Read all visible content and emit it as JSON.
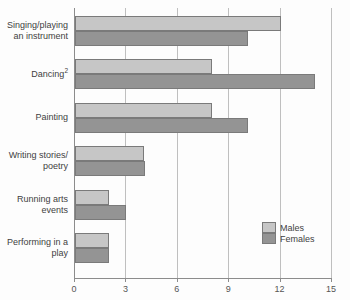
{
  "chart_data": {
    "type": "bar",
    "orientation": "horizontal",
    "title": "",
    "xlabel": "",
    "ylabel": "",
    "xlim": [
      0,
      15
    ],
    "xticks": [
      0,
      3,
      6,
      9,
      12,
      15
    ],
    "xtick_labels": [
      "0",
      "3",
      "6",
      "9",
      "12",
      "15"
    ],
    "grid": true,
    "grid_axis": "x",
    "legend_position": "bottom-right",
    "categories": [
      "Singing/playing an instrument",
      "Dancing",
      "Painting",
      "Writing stories/ poetry",
      "Running arts events",
      "Performing in a play"
    ],
    "category_lines": [
      [
        "Singing/playing",
        "an instrument"
      ],
      [
        "Dancing"
      ],
      [
        "Painting"
      ],
      [
        "Writing stories/",
        "poetry"
      ],
      [
        "Running arts",
        "events"
      ],
      [
        "Performing in a",
        "play"
      ]
    ],
    "category_footnotes": [
      "",
      "2",
      "",
      "",
      "",
      ""
    ],
    "series": [
      {
        "name": "Males",
        "color": "#c6c6c6",
        "values": [
          12,
          8,
          8,
          4,
          2,
          2
        ]
      },
      {
        "name": "Females",
        "color": "#949494",
        "values": [
          10.1,
          14,
          10.1,
          4.1,
          3,
          2
        ]
      }
    ]
  },
  "legend": {
    "items": [
      {
        "label": "Males",
        "color": "#c6c6c6"
      },
      {
        "label": "Females",
        "color": "#949494"
      }
    ]
  }
}
